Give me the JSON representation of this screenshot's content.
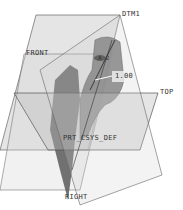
{
  "viewport": {
    "labels": {
      "dtm": "DTM1",
      "front": "FRONT",
      "top": "TOP",
      "right": "RIGHT",
      "csys": "PRT_CSYS_DEF",
      "axis": "A_2",
      "dimension": "1.00"
    },
    "colors": {
      "plane_fill": "#c8c8c8",
      "plane_edge": "#555555",
      "model": "#6e6e6e",
      "model_dark": "#4a4a4a"
    }
  }
}
